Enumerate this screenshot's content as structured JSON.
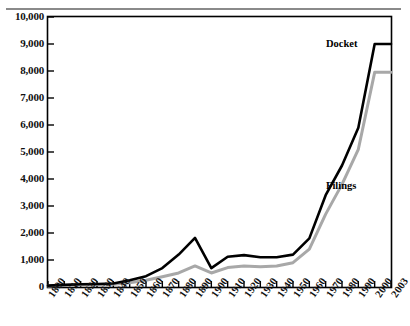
{
  "figure": {
    "partial_title_above": "",
    "background": "#ffffff",
    "frame_color": "#000000"
  },
  "chart_data": {
    "type": "line",
    "title": "",
    "xlabel": "",
    "ylabel": "",
    "ylim": [
      0,
      10000
    ],
    "ytick_step": 1000,
    "grid": false,
    "legend_position": "inline-annotation",
    "ytick_labels": [
      "0",
      "1,000",
      "2,000",
      "3,000",
      "4,000",
      "5,000",
      "6,000",
      "7,000",
      "8,000",
      "9,000",
      "10,000"
    ],
    "ytick_values": [
      0,
      1000,
      2000,
      3000,
      4000,
      5000,
      6000,
      7000,
      8000,
      9000,
      10000
    ],
    "x": [
      1800,
      1810,
      1820,
      1830,
      1840,
      1850,
      1860,
      1870,
      1880,
      1890,
      1900,
      1910,
      1920,
      1930,
      1940,
      1950,
      1960,
      1970,
      1980,
      1990,
      2000,
      2003
    ],
    "xtick_labels": [
      "1800",
      "1810",
      "1820",
      "1830",
      "1840",
      "1850",
      "1860",
      "1870",
      "1880",
      "1890",
      "1900",
      "1910",
      "1920",
      "1930",
      "1940",
      "1950",
      "1960",
      "1970",
      "1980",
      "1990",
      "2000",
      "2003"
    ],
    "series": [
      {
        "name": "Docket",
        "color": "#000000",
        "label_text": "Docket",
        "values": [
          50,
          80,
          100,
          110,
          130,
          250,
          400,
          700,
          1200,
          1820,
          700,
          1120,
          1180,
          1100,
          1100,
          1200,
          1800,
          3400,
          4500,
          5900,
          9000,
          9000
        ]
      },
      {
        "name": "Filings",
        "color": "#a8a8a8",
        "label_text": "Filings",
        "values": [
          40,
          60,
          80,
          90,
          100,
          160,
          250,
          380,
          520,
          780,
          520,
          720,
          780,
          750,
          780,
          900,
          1400,
          2700,
          3800,
          5100,
          7950,
          7950
        ]
      }
    ]
  }
}
